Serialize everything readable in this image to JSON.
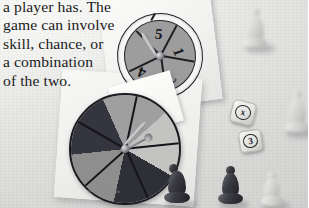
{
  "scene": {
    "kind": "photograph",
    "subject": "board-game spinners, dice and pawn game pieces on a light gray surface",
    "surface_color": "#e8e8e6"
  },
  "body_text": {
    "lines": [
      "a player has. The",
      "game can involve",
      "skill, chance, or",
      "a combination",
      "of the two."
    ],
    "color": "#1b1b20"
  },
  "spinner_top": {
    "label": "numbered spinner",
    "face_color": "#9d9d9d",
    "rim_color": "#f6f6f4",
    "outline_color": "#23232a",
    "sector_count": 5,
    "numbers": [
      "1",
      "2",
      "3",
      "4",
      "5"
    ],
    "visible_numbers": [
      "5",
      "1",
      "2",
      "4"
    ],
    "needle_points_to": "5"
  },
  "spinner_bottom": {
    "label": "color sector spinner",
    "sector_count": 5,
    "sector_colors": [
      "#35353f",
      "#9f9f9f",
      "#2f2f38",
      "#8e8e8e",
      "#c3c3c1"
    ],
    "outline_color": "#1a1a20",
    "needle_color": "#b9b9bd"
  },
  "dice": [
    {
      "name": "die-1",
      "face_value": "x",
      "body_color": "#eeeeec"
    },
    {
      "name": "die-2",
      "face_value": "3",
      "body_color": "#e9e9e6"
    }
  ],
  "pawns": [
    {
      "name": "pawn-top-right",
      "color": "light",
      "focus": "blurred"
    },
    {
      "name": "pawn-right-edge",
      "color": "light",
      "focus": "blurred"
    },
    {
      "name": "pawn-bottom-left",
      "color": "dark",
      "focus": "sharp"
    },
    {
      "name": "pawn-bottom-center",
      "color": "dark",
      "focus": "sharp"
    },
    {
      "name": "pawn-bottom-right",
      "color": "light",
      "focus": "soft"
    }
  ],
  "cards": [
    {
      "name": "card-top",
      "color": "#f6f6f4"
    },
    {
      "name": "card-bottom",
      "color": "#f2f2f0"
    },
    {
      "name": "paper-slip",
      "color": "#fbfbfa"
    }
  ],
  "credit": {
    "text": "photo credit illegible"
  }
}
